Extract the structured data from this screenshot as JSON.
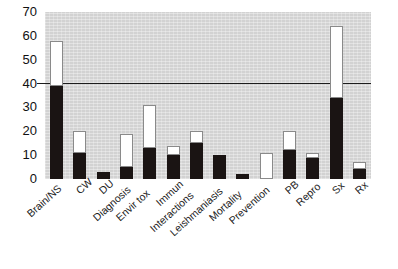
{
  "chart_data": {
    "type": "bar",
    "title": "",
    "subtitle": "",
    "xlabel": "",
    "ylabel": "",
    "ylim": [
      0,
      70
    ],
    "yticks": [
      0,
      10,
      20,
      30,
      40,
      50,
      60,
      70
    ],
    "grid": false,
    "legend": "none",
    "reference_line": 40,
    "stacked": true,
    "categories": [
      "Brain/NS",
      "CW",
      "DU",
      "Diagnosis",
      "Envir tox",
      "Immun",
      "Interactions",
      "Leishmaniasis",
      "Mortality",
      "Prevention",
      "PB",
      "Repro",
      "Sx",
      "Rx"
    ],
    "series": [
      {
        "name": "black-segment",
        "color": "#1a1413",
        "values": [
          39,
          11,
          3,
          5,
          13,
          10,
          15,
          10,
          2,
          0,
          12,
          9,
          34,
          4
        ]
      },
      {
        "name": "white-segment-total",
        "color": "#ffffff",
        "values": [
          58,
          20,
          3,
          19,
          31,
          14,
          20,
          10,
          2,
          11,
          20,
          11,
          64,
          7
        ]
      }
    ],
    "plot_background": "#d2d2d2",
    "page_background": "#ffffff",
    "axis_color": "#1c1c1c"
  }
}
